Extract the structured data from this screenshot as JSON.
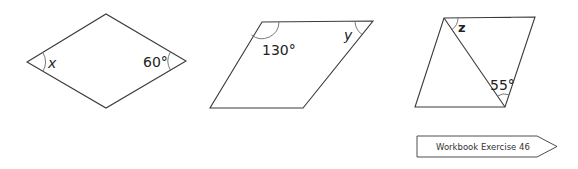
{
  "figures": [
    {
      "id": "rhombus",
      "type": "rhombus",
      "vertices": [
        [
          27,
          62
        ],
        [
          106,
          14
        ],
        [
          186,
          61
        ],
        [
          106,
          108
        ]
      ],
      "angles": [
        {
          "label": "x",
          "vertex": "left",
          "style": "italic"
        },
        {
          "label": "60°",
          "vertex": "right"
        }
      ]
    },
    {
      "id": "parallelogram",
      "type": "parallelogram",
      "vertices": [
        [
          262,
          22
        ],
        [
          373,
          21
        ],
        [
          303,
          108
        ],
        [
          210,
          108
        ]
      ],
      "angles": [
        {
          "label": "130°",
          "vertex": "top-left"
        },
        {
          "label": "y",
          "vertex": "top-right",
          "style": "italic"
        }
      ]
    },
    {
      "id": "parallelogram-diagonal",
      "type": "parallelogram with diagonal",
      "vertices": [
        [
          444,
          18
        ],
        [
          535,
          17
        ],
        [
          505,
          107
        ],
        [
          415,
          107
        ]
      ],
      "diagonal": [
        [
          444,
          18
        ],
        [
          505,
          107
        ]
      ],
      "angles": [
        {
          "label": "z",
          "vertex": "top-left"
        },
        {
          "label": "55°",
          "vertex": "bottom-right"
        }
      ]
    }
  ],
  "labels": {
    "x": "x",
    "sixty": "60°",
    "one_thirty": "130°",
    "y": "y",
    "z": "z",
    "fifty_five": "55°"
  },
  "banner": {
    "text": "Workbook Exercise 46"
  },
  "colors": {
    "stroke": "#3a3a3a",
    "arc": "#6a6a6a",
    "text": "#222222",
    "background": "#ffffff"
  }
}
